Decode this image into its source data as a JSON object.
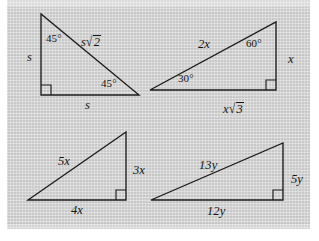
{
  "figure": {
    "background_color": "#c9c9c9",
    "line_color": "#1c1c1c",
    "page_color": "#ffffff"
  },
  "triangles": [
    {
      "name": "triangle-45-45-90",
      "position": "top-left",
      "type": "isosceles right triangle",
      "vertices": {
        "apex": [
          41,
          14
        ],
        "right_angle": [
          41,
          95
        ],
        "base_right": [
          139,
          95
        ]
      },
      "right_angle_at": "bottom-left",
      "labels": {
        "angle_top": "45°",
        "angle_bottom_right": "45°",
        "leg_vertical": "s",
        "leg_horizontal": "s",
        "hypotenuse_var": "s",
        "hypotenuse_radicand": "2",
        "hypotenuse_full": "s√2"
      }
    },
    {
      "name": "triangle-30-60-90",
      "position": "top-right",
      "type": "30-60-90 right triangle",
      "vertices": {
        "left": [
          150,
          90
        ],
        "apex": [
          276,
          22
        ],
        "right_angle": [
          276,
          90
        ]
      },
      "right_angle_at": "bottom-right",
      "labels": {
        "angle_left": "30°",
        "angle_top": "60°",
        "hypotenuse": "2x",
        "leg_vertical": "x",
        "leg_horizontal_var": "x",
        "leg_horizontal_radicand": "3",
        "leg_horizontal_full": "x√3"
      }
    },
    {
      "name": "triangle-3-4-5",
      "position": "bottom-left",
      "type": "3-4-5 right triangle",
      "vertices": {
        "left": [
          28,
          200
        ],
        "apex": [
          126,
          132
        ],
        "right_angle": [
          126,
          200
        ]
      },
      "right_angle_at": "bottom-right",
      "labels": {
        "hypotenuse": "5x",
        "leg_vertical": "3x",
        "leg_horizontal": "4x"
      }
    },
    {
      "name": "triangle-5-12-13",
      "position": "bottom-right",
      "type": "5-12-13 right triangle",
      "vertices": {
        "left": [
          151,
          200
        ],
        "apex": [
          283,
          143
        ],
        "right_angle": [
          283,
          200
        ]
      },
      "right_angle_at": "bottom-right",
      "labels": {
        "hypotenuse": "13y",
        "leg_vertical": "5y",
        "leg_horizontal": "12y"
      }
    }
  ]
}
